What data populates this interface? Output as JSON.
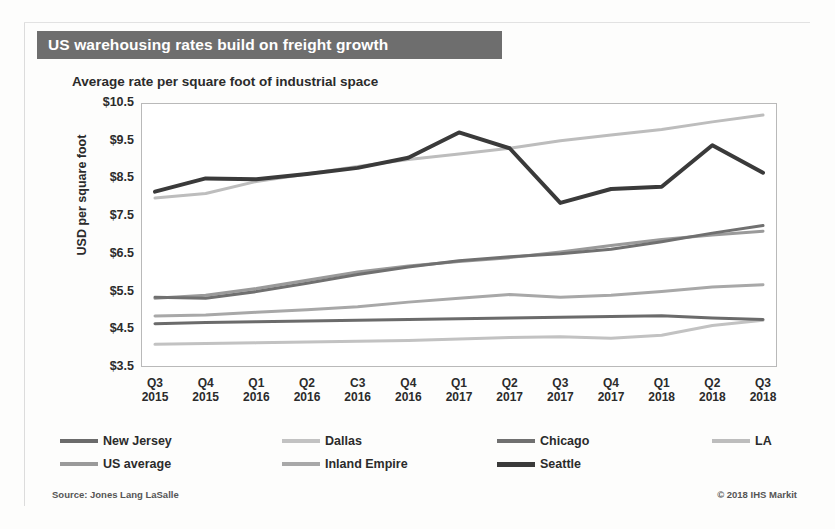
{
  "header": {
    "title": "US warehousing rates build on freight growth",
    "subtitle": "Average rate per square foot of industrial space",
    "title_bar_color": "#6e6e6e"
  },
  "footer": {
    "source": "Source: Jones Lang LaSalle",
    "credit": "© 2018 IHS Markit"
  },
  "chart_data": {
    "type": "line",
    "title": "US warehousing rates build on freight growth",
    "subtitle": "Average rate per square foot of industrial space",
    "xlabel": "",
    "ylabel": "USD per square foot",
    "ylim": [
      3.5,
      10.5
    ],
    "ytick_step": 1.0,
    "yticks": [
      "$3.5",
      "$4.5",
      "$5.5",
      "$6.5",
      "$7.5",
      "$8.5",
      "$9.5",
      "$10.5"
    ],
    "ytick_values": [
      3.5,
      4.5,
      5.5,
      6.5,
      7.5,
      8.5,
      9.5,
      10.5
    ],
    "grid": false,
    "legend_position": "bottom",
    "categories": [
      {
        "q": "Q3",
        "yr": "2015"
      },
      {
        "q": "Q4",
        "yr": "2015"
      },
      {
        "q": "Q1",
        "yr": "2016"
      },
      {
        "q": "Q2",
        "yr": "2016"
      },
      {
        "q": "C3",
        "yr": "2016"
      },
      {
        "q": "Q4",
        "yr": "2016"
      },
      {
        "q": "Q1",
        "yr": "2017"
      },
      {
        "q": "Q2",
        "yr": "2017"
      },
      {
        "q": "Q3",
        "yr": "2017"
      },
      {
        "q": "Q4",
        "yr": "2017"
      },
      {
        "q": "Q1",
        "yr": "2018"
      },
      {
        "q": "Q2",
        "yr": "2018"
      },
      {
        "q": "Q3",
        "yr": "2018"
      }
    ],
    "series": [
      {
        "name": "New Jersey",
        "color": "#6b6b6b",
        "width": 3.0,
        "values": [
          4.65,
          4.68,
          4.7,
          4.72,
          4.74,
          4.76,
          4.78,
          4.8,
          4.82,
          4.84,
          4.86,
          4.8,
          4.76
        ]
      },
      {
        "name": "Dallas",
        "color": "#c2c2c2",
        "width": 3.0,
        "values": [
          4.1,
          4.12,
          4.14,
          4.16,
          4.18,
          4.2,
          4.24,
          4.28,
          4.3,
          4.26,
          4.34,
          4.6,
          4.74
        ]
      },
      {
        "name": "Chicago",
        "color": "#707070",
        "width": 3.0,
        "values": [
          5.35,
          5.32,
          5.5,
          5.72,
          5.95,
          6.15,
          6.32,
          6.42,
          6.5,
          6.62,
          6.82,
          7.05,
          7.25
        ]
      },
      {
        "name": "LA",
        "color": "#bdbdbd",
        "width": 3.0,
        "values": [
          7.98,
          8.1,
          8.42,
          8.62,
          8.82,
          9.0,
          9.15,
          9.3,
          9.5,
          9.65,
          9.8,
          10.0,
          10.18
        ]
      },
      {
        "name": "US average",
        "color": "#9a9a9a",
        "width": 3.0,
        "values": [
          5.32,
          5.4,
          5.58,
          5.8,
          6.02,
          6.18,
          6.3,
          6.4,
          6.55,
          6.72,
          6.88,
          7.0,
          7.1
        ]
      },
      {
        "name": "Inland Empire",
        "color": "#a8a8a8",
        "width": 3.0,
        "values": [
          4.85,
          4.88,
          4.95,
          5.02,
          5.1,
          5.22,
          5.32,
          5.42,
          5.35,
          5.4,
          5.5,
          5.62,
          5.68
        ]
      },
      {
        "name": "Seattle",
        "color": "#3a3a3a",
        "width": 4.0,
        "values": [
          8.15,
          8.5,
          8.48,
          8.62,
          8.78,
          9.05,
          9.72,
          9.3,
          7.85,
          8.22,
          8.28,
          9.38,
          8.65
        ]
      }
    ]
  }
}
